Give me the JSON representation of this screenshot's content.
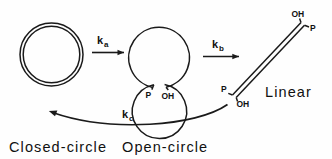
{
  "figure": {
    "type": "reaction-scheme",
    "background": "#fefefe",
    "ink_color": "#1a1a1a",
    "species": [
      {
        "id": "closed-circle",
        "label": "Closed-circle",
        "shape": "double-line closed circle",
        "center": [
          51.5,
          54.5
        ],
        "radius": 31,
        "end_labels": []
      },
      {
        "id": "open-circle",
        "label": "Open-circle",
        "shape": "double-line circle with nick at bottom",
        "center": [
          159,
          58
        ],
        "radius": 30,
        "end_labels": [
          "P",
          "OH"
        ]
      },
      {
        "id": "linear",
        "label": "Linear",
        "shape": "double-line diagonal rod",
        "end_labels": [
          "OH",
          "P",
          "P",
          "OH"
        ]
      }
    ],
    "reactions": [
      {
        "id": "ka",
        "rate_symbol": "k",
        "rate_subscript": "a",
        "from": "closed-circle",
        "to": "open-circle",
        "arrow": "straight-right"
      },
      {
        "id": "kb",
        "rate_symbol": "k",
        "rate_subscript": "b",
        "from": "open-circle",
        "to": "linear",
        "arrow": "straight-right"
      },
      {
        "id": "kc",
        "rate_symbol": "k",
        "rate_subscript": "c",
        "from": "linear",
        "to": "closed-circle",
        "arrow": "curved-left"
      }
    ],
    "labels": {
      "closed_circle": "Closed-circle",
      "open_circle": "Open-circle",
      "linear": "Linear",
      "ka_symbol": "k",
      "ka_sub": "a",
      "kb_symbol": "k",
      "kb_sub": "b",
      "kc_symbol": "k",
      "kc_sub": "c",
      "open_circle_p": "P",
      "open_circle_oh": "OH",
      "linear_top_oh": "OH",
      "linear_top_p": "P",
      "linear_bottom_p": "P",
      "linear_bottom_oh": "OH"
    }
  }
}
